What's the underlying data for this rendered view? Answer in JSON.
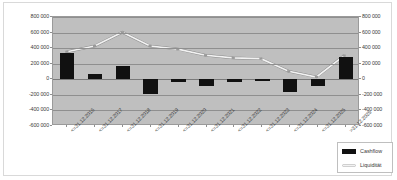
{
  "chart_data": {
    "type": "bar",
    "title": "",
    "xlabel": "",
    "ylabel": "",
    "ylim": [
      -600000,
      800000
    ],
    "y_axis_right": true,
    "grid": true,
    "legend_position": "bottom-right",
    "yticks": [
      "800 000",
      "600 000",
      "400 000",
      "200 000",
      "0",
      "-200 000",
      "-400 000",
      "-600 000"
    ],
    "ytick_values": [
      800000,
      600000,
      400000,
      200000,
      0,
      -200000,
      -400000,
      -600000
    ],
    "yticks_right": [
      "800 000",
      "600 000",
      "400 000",
      "200 000",
      "0",
      "-200 000",
      "-400 000",
      "-600 000"
    ],
    "categories": [
      "<=31.12.2016",
      "<=31.12.2017",
      "<=31.12.2018",
      "<=31.12.2019",
      "<=31.12.2020",
      "<=31.12.2021",
      "<=31.12.2022",
      "<=31.12.2023",
      "<=31.12.2024",
      "<=31.12.2025",
      ">31.12.2025"
    ],
    "series": [
      {
        "name": "Cashflow",
        "type": "bar",
        "color": "#111111",
        "values": [
          340000,
          70000,
          175000,
          -195000,
          -35000,
          -80000,
          -35000,
          -20000,
          -165000,
          -80000,
          285000
        ]
      },
      {
        "name": "Liquidität",
        "type": "line",
        "color": "#f2f2f2",
        "values": [
          345000,
          420000,
          600000,
          420000,
          380000,
          300000,
          265000,
          255000,
          90000,
          15000,
          295000
        ]
      }
    ]
  },
  "legend": {
    "entries": [
      {
        "label": "Cashflow",
        "marker": "bar-swatch"
      },
      {
        "label": "Liquidität",
        "marker": "line-swatch"
      }
    ]
  }
}
